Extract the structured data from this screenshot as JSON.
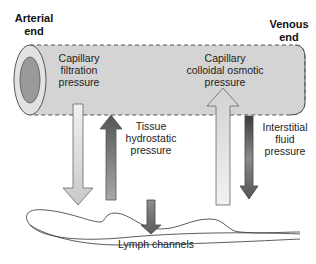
{
  "labels": {
    "arterial_end": [
      "Arterial",
      "end"
    ],
    "venous_end": [
      "Venous",
      "end"
    ],
    "capillary_filtration": [
      "Capillary",
      "filtration",
      "pressure"
    ],
    "capillary_colloidal": [
      "Capillary",
      "colloidal osmotic",
      "pressure"
    ],
    "tissue_hydrostatic": [
      "Tissue",
      "hydrostatic",
      "pressure"
    ],
    "interstitial_fluid": [
      "Interstitial",
      "fluid",
      "pressure"
    ],
    "lymph_channels": "Lymph channels"
  },
  "colors": {
    "tube_fill": "#d4d4d4",
    "tube_outline": "#555555",
    "tube_end_ring": "#e2e2e2",
    "tube_end_inner": "#9a9a9a",
    "light_arrow": "#e4e4e4",
    "dark_arrow": "#6a6a6a"
  }
}
